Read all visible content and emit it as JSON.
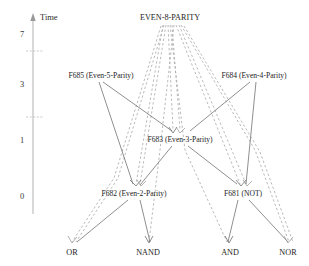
{
  "diagram": {
    "title_axis": "Time",
    "axis": {
      "label": "Time",
      "ticks": [
        {
          "value": "7",
          "y": 34
        },
        {
          "value": "3",
          "y": 84
        },
        {
          "value": "1",
          "y": 140
        },
        {
          "value": "0",
          "y": 196
        }
      ],
      "minor_marks": [
        {
          "y": 51
        },
        {
          "y": 117
        }
      ]
    },
    "nodes": [
      {
        "id": "root",
        "label": "EVEN-8-PARITY",
        "x": 170,
        "y": 17,
        "anchor": "middle",
        "kind": "root"
      },
      {
        "id": "f685",
        "label": "F685  (Even-5-Parity)",
        "x": 101,
        "y": 75,
        "anchor": "middle",
        "kind": "function"
      },
      {
        "id": "f684",
        "label": "F684  (Even-4-Parity)",
        "x": 254,
        "y": 75,
        "anchor": "middle",
        "kind": "function"
      },
      {
        "id": "f683",
        "label": "F683 (Even-3-Parity)",
        "x": 180,
        "y": 139,
        "anchor": "middle",
        "kind": "function"
      },
      {
        "id": "f682",
        "label": "F682 (Even-2-Parity)",
        "x": 134,
        "y": 193,
        "anchor": "middle",
        "kind": "function"
      },
      {
        "id": "f681",
        "label": "F681 (NOT)",
        "x": 243,
        "y": 193,
        "anchor": "middle",
        "kind": "function"
      },
      {
        "id": "or",
        "label": "OR",
        "x": 72,
        "y": 252,
        "anchor": "middle",
        "kind": "terminal"
      },
      {
        "id": "nand",
        "label": "NAND",
        "x": 148,
        "y": 252,
        "anchor": "middle",
        "kind": "terminal"
      },
      {
        "id": "and",
        "label": "AND",
        "x": 230,
        "y": 252,
        "anchor": "middle",
        "kind": "terminal"
      },
      {
        "id": "nor",
        "label": "NOR",
        "x": 288,
        "y": 252,
        "anchor": "middle",
        "kind": "terminal"
      }
    ],
    "edge_styles": {
      "solid": "solid",
      "dashed": "dashed"
    },
    "edges": [
      {
        "from": "root",
        "to": "f683",
        "style": "dashed"
      },
      {
        "from": "root",
        "to": "f683",
        "style": "dashed"
      },
      {
        "from": "root",
        "to": "f682",
        "style": "dashed"
      },
      {
        "from": "root",
        "to": "or",
        "style": "dashed"
      },
      {
        "from": "root",
        "to": "nand",
        "style": "dashed"
      },
      {
        "from": "root",
        "to": "and",
        "style": "dashed"
      },
      {
        "from": "root",
        "to": "nor",
        "style": "dashed"
      },
      {
        "from": "root",
        "to": "f681",
        "style": "dashed"
      },
      {
        "from": "f685",
        "to": "f683",
        "style": "solid"
      },
      {
        "from": "f685",
        "to": "f682",
        "style": "solid"
      },
      {
        "from": "f684",
        "to": "f683",
        "style": "solid"
      },
      {
        "from": "f684",
        "to": "f681",
        "style": "solid"
      },
      {
        "from": "f683",
        "to": "f682",
        "style": "solid"
      },
      {
        "from": "f683",
        "to": "f681",
        "style": "solid"
      },
      {
        "from": "f682",
        "to": "or",
        "style": "solid"
      },
      {
        "from": "f682",
        "to": "nand",
        "style": "solid"
      },
      {
        "from": "f681",
        "to": "and",
        "style": "solid"
      },
      {
        "from": "f681",
        "to": "nor",
        "style": "solid"
      }
    ]
  }
}
